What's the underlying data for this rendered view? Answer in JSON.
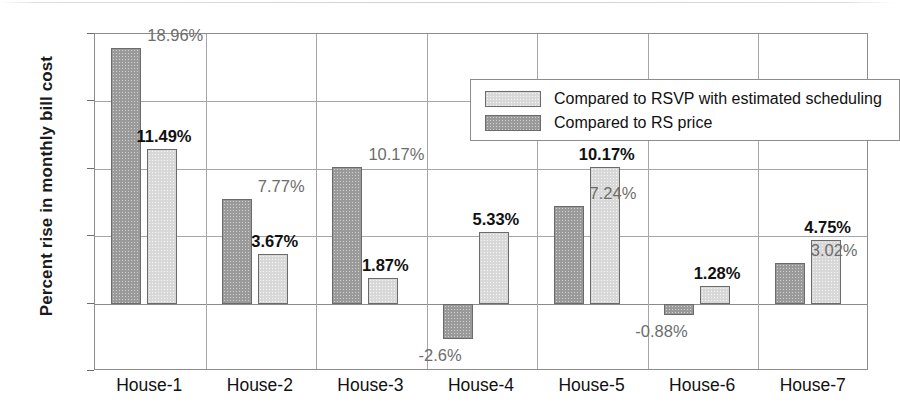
{
  "chart_data": {
    "type": "bar",
    "title": "",
    "xlabel": "",
    "ylabel": "Percent rise in monthly bill cost",
    "categories": [
      "House-1",
      "House-2",
      "House-3",
      "House-4",
      "House-5",
      "House-6",
      "House-7"
    ],
    "ylim": [
      -5,
      20
    ],
    "yticks": [
      20,
      15,
      10,
      5,
      0,
      -5
    ],
    "ytick_labels": [
      "20",
      "15",
      "10",
      "5",
      "0",
      "-5"
    ],
    "grid": true,
    "legend_position": "top-right-inside",
    "series": [
      {
        "name": "Compared to RS price",
        "key": "dark",
        "color": "#9a9a9a",
        "label_color": "#6d6d6d",
        "label_weight": "normal",
        "values": [
          18.96,
          7.77,
          10.17,
          -2.6,
          7.24,
          -0.88,
          3.02
        ],
        "data_labels": [
          "18.96%",
          "7.77%",
          "10.17%",
          "-2.6%",
          "7.24%",
          "-0.88%",
          "3.02%"
        ]
      },
      {
        "name": "Compared to RSVP with estimated scheduling",
        "key": "light",
        "color": "#d8d8d8",
        "label_color": "#111111",
        "label_weight": "bold",
        "values": [
          11.49,
          3.67,
          1.87,
          5.33,
          10.17,
          1.28,
          4.75
        ],
        "data_labels": [
          "11.49%",
          "3.67%",
          "1.87%",
          "5.33%",
          "10.17%",
          "1.28%",
          "4.75%"
        ]
      }
    ]
  },
  "legend": {
    "entries": [
      {
        "label": "Compared to RSVP with estimated scheduling",
        "swatch": "light"
      },
      {
        "label": "Compared to RS price",
        "swatch": "dark"
      }
    ]
  },
  "axis": {
    "y_title": "Percent rise in monthly bill cost"
  }
}
